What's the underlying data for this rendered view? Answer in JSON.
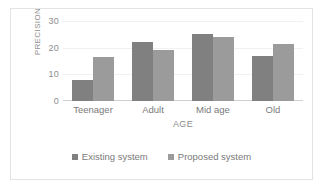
{
  "chart_data": {
    "type": "bar",
    "title": "",
    "xlabel": "AGE",
    "ylabel": "PRECISION",
    "categories": [
      "Teenager",
      "Adult",
      "Mid age",
      "Old"
    ],
    "series": [
      {
        "name": "Existing system",
        "color": "#808080",
        "values": [
          8,
          22,
          25,
          17
        ]
      },
      {
        "name": "Proposed system",
        "color": "#9b9b9b",
        "values": [
          16.5,
          19,
          24,
          21.5
        ]
      }
    ],
    "ylim": [
      0,
      30
    ],
    "yticks": [
      0,
      10,
      20,
      30
    ],
    "ytick_labels": [
      "0",
      "10",
      "20",
      "30"
    ],
    "grid": true,
    "legend_position": "bottom"
  }
}
